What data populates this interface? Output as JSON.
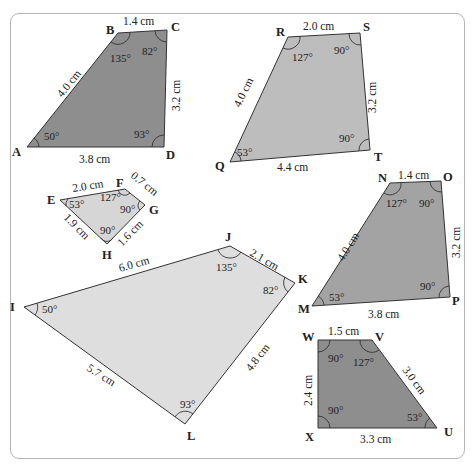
{
  "figure": {
    "frame": {
      "border_color": "#b5b5b5"
    },
    "shapes": [
      {
        "id": "ABCD",
        "fill": "#8e8e8e",
        "vertices": [
          {
            "label": "A",
            "x": 27,
            "y": 147
          },
          {
            "label": "B",
            "x": 118,
            "y": 33
          },
          {
            "label": "C",
            "x": 167,
            "y": 30
          },
          {
            "label": "D",
            "x": 164,
            "y": 147
          }
        ],
        "sides": {
          "AB": "4.0 cm",
          "BC": "1.4 cm",
          "CD": "3.2 cm",
          "DA": "3.8 cm"
        },
        "angles": {
          "A": "50°",
          "B": "135°",
          "C": "82°",
          "D": "93°"
        }
      },
      {
        "id": "QRST",
        "fill": "#bdbdbd",
        "vertices": [
          {
            "label": "Q",
            "x": 230,
            "y": 162
          },
          {
            "label": "R",
            "x": 288,
            "y": 37
          },
          {
            "label": "S",
            "x": 360,
            "y": 33
          },
          {
            "label": "T",
            "x": 370,
            "y": 150
          }
        ],
        "sides": {
          "QR": "4.0 cm",
          "RS": "2.0 cm",
          "ST": "3.2 cm",
          "TQ": "4.4 cm"
        },
        "angles": {
          "Q": "53°",
          "R": "127°",
          "S": "90°",
          "T": "90°"
        }
      },
      {
        "id": "EFGH",
        "fill": "#d6d6d6",
        "vertices": [
          {
            "label": "E",
            "x": 60,
            "y": 200
          },
          {
            "label": "F",
            "x": 125,
            "y": 189
          },
          {
            "label": "G",
            "x": 145,
            "y": 205
          },
          {
            "label": "H",
            "x": 107,
            "y": 244
          }
        ],
        "sides": {
          "EF": "2.0 cm",
          "FG": "0.7 cm",
          "GH": "1.6 cm",
          "HE": "1.9 cm"
        },
        "angles": {
          "E": "53°",
          "F": "127°",
          "G": "90°",
          "H": "90°"
        }
      },
      {
        "id": "IJKL",
        "fill": "#dedede",
        "vertices": [
          {
            "label": "I",
            "x": 24,
            "y": 307
          },
          {
            "label": "J",
            "x": 230,
            "y": 246
          },
          {
            "label": "K",
            "x": 295,
            "y": 283
          },
          {
            "label": "L",
            "x": 185,
            "y": 424
          }
        ],
        "sides": {
          "IJ": "6.0 cm",
          "JK": "2.1 cm",
          "KL": "4.8 cm",
          "LI": "5.7 cm"
        },
        "angles": {
          "I": "50°",
          "J": "135°",
          "K": "82°",
          "L": "93°"
        }
      },
      {
        "id": "MNOP",
        "fill": "#a3a3a3",
        "vertices": [
          {
            "label": "M",
            "x": 312,
            "y": 306
          },
          {
            "label": "N",
            "x": 390,
            "y": 183
          },
          {
            "label": "O",
            "x": 441,
            "y": 181
          },
          {
            "label": "P",
            "x": 450,
            "y": 297
          }
        ],
        "sides": {
          "MN": "4.0 cm",
          "NO": "1.4 cm",
          "OP": "3.2 cm",
          "PM": "3.8 cm"
        },
        "angles": {
          "M": "53°",
          "N": "127°",
          "O": "90°",
          "P": "90°"
        }
      },
      {
        "id": "WVUX",
        "fill": "#8e8e8e",
        "vertices": [
          {
            "label": "W",
            "x": 318,
            "y": 340
          },
          {
            "label": "V",
            "x": 372,
            "y": 340
          },
          {
            "label": "U",
            "x": 437,
            "y": 428
          },
          {
            "label": "X",
            "x": 318,
            "y": 428
          }
        ],
        "sides": {
          "WV": "1.5 cm",
          "VU": "3.0 cm",
          "UX": "3.3 cm",
          "XW": "2.4 cm"
        },
        "angles": {
          "W": "90°",
          "V": "127°",
          "U": "53°",
          "X": "90°"
        }
      }
    ]
  }
}
